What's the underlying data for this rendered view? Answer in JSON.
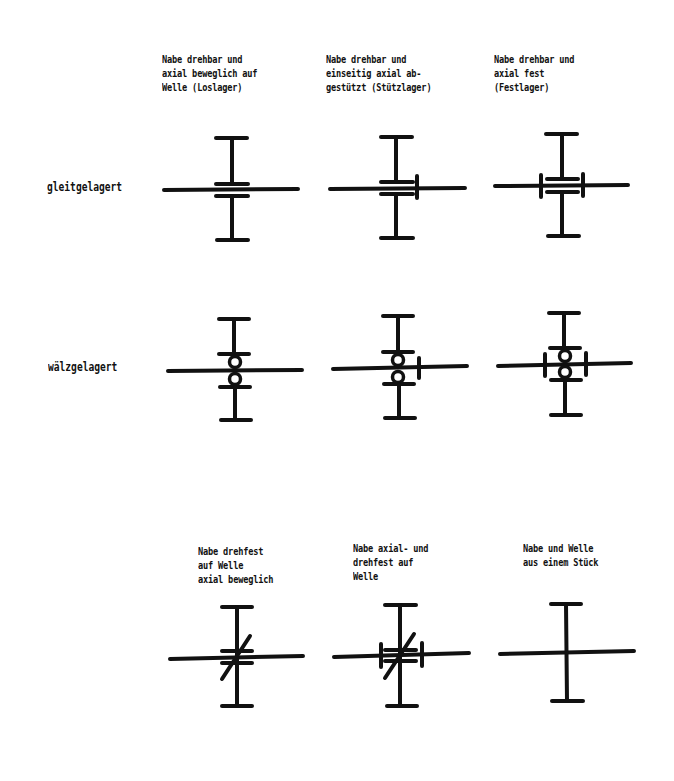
{
  "columns_top": [
    {
      "caption": "Nabe drehbar und\naxial beweglich auf\nWelle (Loslager)"
    },
    {
      "caption": "Nabe drehbar und\neinseitig axial ab-\ngestützt (Stützlager)"
    },
    {
      "caption": "Nabe drehbar und\naxial fest\n(Festlager)"
    }
  ],
  "rows": [
    {
      "label": "gleitgelagert"
    },
    {
      "label": "wälzgelagert"
    }
  ],
  "columns_bottom": [
    {
      "caption": "Nabe drehfest\nauf Welle\naxial beweglich"
    },
    {
      "caption": "Nabe axial- und\ndrehfest auf\nWelle"
    },
    {
      "caption": "Nabe und Welle\naus einem Stück"
    }
  ],
  "symbols": [
    {
      "id": "gleit-loslager",
      "type": "sliding-bearing",
      "axial": "free"
    },
    {
      "id": "gleit-stuetzlager",
      "type": "sliding-bearing",
      "axial": "one-side"
    },
    {
      "id": "gleit-festlager",
      "type": "sliding-bearing",
      "axial": "fixed"
    },
    {
      "id": "waelz-loslager",
      "type": "rolling-bearing",
      "axial": "free"
    },
    {
      "id": "waelz-stuetzlager",
      "type": "rolling-bearing",
      "axial": "one-side"
    },
    {
      "id": "waelz-festlager",
      "type": "rolling-bearing",
      "axial": "fixed"
    },
    {
      "id": "drehfest-axial-beweglich",
      "type": "rotation-fixed",
      "axial": "free"
    },
    {
      "id": "drehfest-axial-fest",
      "type": "rotation-fixed",
      "axial": "fixed"
    },
    {
      "id": "einteilig",
      "type": "one-piece",
      "axial": "fixed"
    }
  ]
}
